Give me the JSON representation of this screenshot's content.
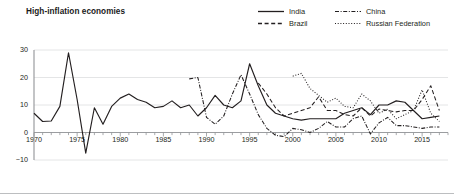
{
  "title": "High-inflation economies",
  "legend": {
    "position": "top-right",
    "entries": [
      {
        "label": "India",
        "style": "solid",
        "key": "india"
      },
      {
        "label": "Brazil",
        "style": "dashed",
        "key": "brazil"
      },
      {
        "label": "China",
        "style": "dash-dot",
        "key": "china"
      },
      {
        "label": "Russian Federation",
        "style": "dotted",
        "key": "russia"
      }
    ]
  },
  "colors": {
    "line": "#231f20",
    "grid": "#e4e5e6",
    "axis": "#929497",
    "frame": "#bcbec0",
    "text": "#231f20"
  },
  "axes": {
    "y_ticks": [
      "30",
      "20",
      "10",
      "0",
      "-10"
    ],
    "x_ticks": [
      "1970",
      "1975",
      "1980",
      "1985",
      "1990",
      "1995",
      "2000",
      "2005",
      "2010",
      "2015"
    ]
  },
  "chart_data": {
    "type": "line",
    "title": "High-inflation economies",
    "xlabel": "",
    "ylabel": "",
    "xlim": [
      1970,
      2018
    ],
    "ylim": [
      -10,
      30
    ],
    "yticks": [
      -10,
      0,
      10,
      20,
      30
    ],
    "xticks": [
      1970,
      1975,
      1980,
      1985,
      1990,
      1995,
      2000,
      2005,
      2010,
      2015
    ],
    "grid": true,
    "grid_axis": "y",
    "legend_position": "top-right",
    "series": [
      {
        "name": "India",
        "style": "solid",
        "x": [
          1970,
          1971,
          1972,
          1973,
          1974,
          1975,
          1976,
          1977,
          1978,
          1979,
          1980,
          1981,
          1982,
          1983,
          1984,
          1985,
          1986,
          1987,
          1988,
          1989,
          1990,
          1991,
          1992,
          1993,
          1994,
          1995,
          1996,
          1997,
          1998,
          1999,
          2000,
          2001,
          2002,
          2003,
          2004,
          2005,
          2006,
          2007,
          2008,
          2009,
          2010,
          2011,
          2012,
          2013,
          2014,
          2015,
          2016,
          2017
        ],
        "y": [
          7.0,
          4.0,
          4.2,
          9.5,
          29.0,
          12.0,
          -7.5,
          9.0,
          3.0,
          9.5,
          12.5,
          14.0,
          12.0,
          11.0,
          9.0,
          9.5,
          11.5,
          9.0,
          10.0,
          6.0,
          9.0,
          13.5,
          10.0,
          9.0,
          11.5,
          25.0,
          17.0,
          10.0,
          7.0,
          6.0,
          5.0,
          4.5,
          5.0,
          5.0,
          5.0,
          5.0,
          7.0,
          8.0,
          9.0,
          6.5,
          10.0,
          10.0,
          11.5,
          11.0,
          8.0,
          5.0,
          5.5,
          6.0
        ]
      },
      {
        "name": "Brazil",
        "style": "dashed",
        "x": [
          1996,
          1997,
          1998,
          1999,
          2000,
          2001,
          2002,
          2003,
          2004,
          2005,
          2006,
          2007,
          2008,
          2009,
          2010,
          2011,
          2012,
          2013,
          2014,
          2015,
          2016,
          2017
        ],
        "y": [
          18.0,
          14.0,
          9.0,
          6.0,
          7.0,
          8.0,
          9.0,
          13.0,
          8.0,
          8.0,
          6.5,
          6.0,
          9.0,
          6.0,
          8.5,
          8.0,
          7.5,
          8.0,
          8.0,
          12.0,
          17.0,
          8.0
        ]
      },
      {
        "name": "China",
        "style": "dash-dot",
        "x": [
          1988,
          1989,
          1990,
          1991,
          1992,
          1993,
          1994,
          1995,
          1996,
          1997,
          1998,
          1999,
          2000,
          2001,
          2002,
          2003,
          2004,
          2005,
          2006,
          2007,
          2008,
          2009,
          2010,
          2011,
          2012,
          2013,
          2014,
          2015,
          2016,
          2017
        ],
        "y": [
          19.5,
          20.0,
          5.5,
          3.0,
          6.0,
          14.0,
          21.0,
          14.0,
          6.5,
          1.5,
          -1.0,
          -1.5,
          1.5,
          1.0,
          0.0,
          1.5,
          4.0,
          2.0,
          2.0,
          5.0,
          6.0,
          -0.5,
          3.5,
          5.5,
          2.5,
          2.5,
          2.0,
          1.5,
          2.0,
          2.0
        ]
      },
      {
        "name": "Russian Federation",
        "style": "dotted",
        "x": [
          2000,
          2001,
          2002,
          2003,
          2004,
          2005,
          2006,
          2007,
          2008,
          2009,
          2010,
          2011,
          2012,
          2013,
          2014,
          2015,
          2016,
          2017
        ],
        "y": [
          20.5,
          21.5,
          16.0,
          13.5,
          11.0,
          12.5,
          9.5,
          9.0,
          14.0,
          11.5,
          7.0,
          8.5,
          5.0,
          6.5,
          8.0,
          15.5,
          7.0,
          4.0
        ]
      }
    ]
  }
}
